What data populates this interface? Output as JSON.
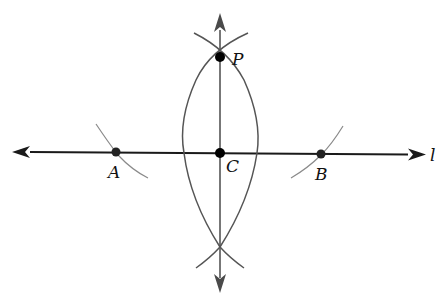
{
  "diagram": {
    "line_label": "l",
    "points": {
      "P": {
        "label": "P",
        "x": 220,
        "y": 57
      },
      "C": {
        "label": "C",
        "x": 220,
        "y": 153
      },
      "A": {
        "label": "A",
        "x": 116,
        "y": 152
      },
      "B": {
        "label": "B",
        "x": 321,
        "y": 154
      }
    },
    "colors": {
      "line": "#1a1a1a",
      "arc": "#555555",
      "arc_light": "#8a8a8a",
      "point": "#000000"
    }
  }
}
